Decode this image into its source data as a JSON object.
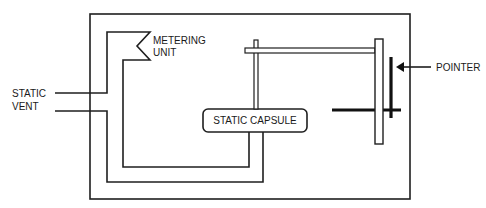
{
  "diagram": {
    "labels": {
      "static_vent_line1": "STATIC",
      "static_vent_line2": "VENT",
      "metering_line1": "METERING",
      "metering_line2": "UNIT",
      "capsule": "STATIC CAPSULE",
      "pointer": "POINTER"
    },
    "colors": {
      "line": "#1f1f1f",
      "background": "#ffffff"
    }
  }
}
